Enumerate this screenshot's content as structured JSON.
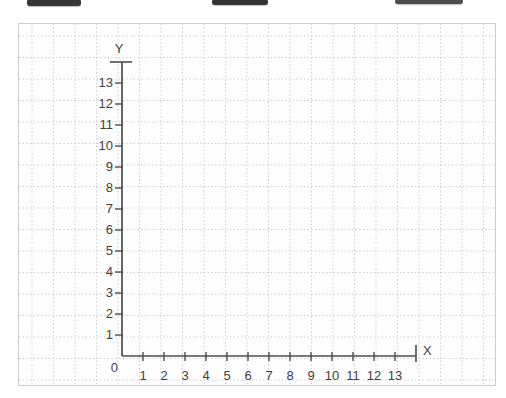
{
  "top_fragments": [
    {
      "name": "ui-fragment-left"
    },
    {
      "name": "ui-fragment-center"
    },
    {
      "name": "ui-fragment-right"
    }
  ],
  "chart_data": {
    "type": "scatter",
    "title": "",
    "xlabel": "X",
    "ylabel": "Y",
    "origin_label": "0",
    "x_ticks": [
      1,
      2,
      3,
      4,
      5,
      6,
      7,
      8,
      9,
      10,
      11,
      12,
      13
    ],
    "y_ticks": [
      1,
      2,
      3,
      4,
      5,
      6,
      7,
      8,
      9,
      10,
      11,
      12,
      13
    ],
    "xlim": [
      0,
      14
    ],
    "ylim": [
      0,
      14
    ],
    "grid": true,
    "grid_style": "dotted graph paper",
    "legend": false,
    "series": [],
    "points": []
  },
  "colors": {
    "page_background": "#ffffff",
    "panel_background": "#fefefe",
    "panel_border": "#c9cbce",
    "grid_line": "#c5c8cc",
    "axis": "#4c4c4c",
    "tick_label": "#3e3e3e",
    "fragment_fill": "#353535",
    "fragment_fill_light": "#4d4d4d"
  }
}
